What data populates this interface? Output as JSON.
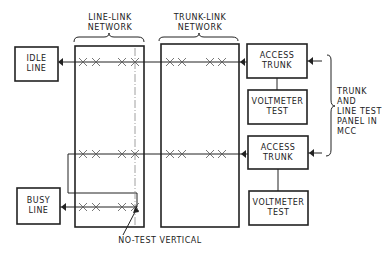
{
  "diagram": {
    "networks": {
      "line_link": {
        "label": "LINE-LINK\nNETWORK"
      },
      "trunk_link": {
        "label": "TRUNK-LINK\nNETWORK"
      }
    },
    "lines": {
      "idle": {
        "label": "IDLE\nLINE"
      },
      "busy": {
        "label": "BUSY\nLINE"
      }
    },
    "access_trunks": [
      {
        "label": "ACCESS\nTRUNK"
      },
      {
        "label": "ACCESS\nTRUNK"
      }
    ],
    "voltmeter_tests": [
      {
        "label": "VOLTMETER\nTEST"
      },
      {
        "label": "VOLTMETER\nTEST"
      }
    ],
    "panel": {
      "label": "TRUNK AND\nLINE TEST\nPANEL IN\nMCC"
    },
    "annotation": {
      "label": "NO-TEST VERTICAL"
    },
    "colors": {
      "ink": "#222222",
      "background": "#ffffff",
      "dashed": "#888888"
    }
  }
}
